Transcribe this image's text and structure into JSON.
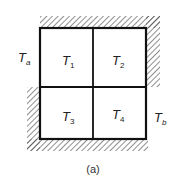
{
  "diagram": {
    "caption": "(a)",
    "cells": [
      {
        "name": "T",
        "sub": "1"
      },
      {
        "name": "T",
        "sub": "2"
      },
      {
        "name": "T",
        "sub": "3"
      },
      {
        "name": "T",
        "sub": "4"
      }
    ],
    "boundary_labels": {
      "left": {
        "name": "T",
        "sub": "a"
      },
      "right": {
        "name": "T",
        "sub": "b"
      }
    },
    "colors": {
      "line": "#111111",
      "hatch": "#444444",
      "background": "#ffffff"
    }
  }
}
